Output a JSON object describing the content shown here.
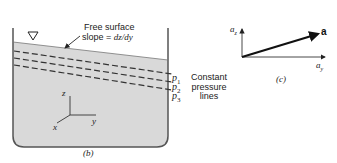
{
  "panel_b": {
    "annotation_line1": "Free surface",
    "annotation_line2": "slope = ",
    "annotation_slope": "dz/dy",
    "pressure_labels": [
      "p",
      "p",
      "p"
    ],
    "pressure_subscripts": [
      "1",
      "2",
      "3"
    ],
    "legend_lines": [
      "Constant",
      "pressure",
      "lines"
    ],
    "axes": {
      "z": "z",
      "y": "y",
      "x": "x"
    },
    "caption": "(b)",
    "colors": {
      "fluid": "#d9d9d9",
      "wall": "#555555",
      "line": "#333333"
    }
  },
  "panel_c": {
    "vertical_axis": "a",
    "vertical_sub": "z",
    "horizontal_axis": "a",
    "horizontal_sub": "y",
    "vector_label": "a",
    "caption": "(c)"
  }
}
